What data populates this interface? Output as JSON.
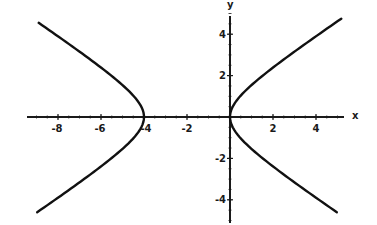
{
  "chart_data": {
    "type": "line",
    "title": "",
    "xlabel": "x",
    "ylabel": "y",
    "xlim": [
      -9.3,
      5.3
    ],
    "ylim": [
      -5.0,
      5.0
    ],
    "grid": false,
    "legend": null,
    "x_ticks": [
      -8,
      -6,
      -4,
      -2,
      2,
      4
    ],
    "x_tick_labels": [
      "-8",
      "-6",
      "-4",
      "-2",
      "2",
      "4"
    ],
    "y_ticks": [
      4,
      2,
      -2,
      -4
    ],
    "y_tick_labels": [
      "4",
      "2",
      "-2",
      "-4"
    ],
    "curve_description": "Hyperbola with vertices at (-4, 0) and (0, 0), centered at (-2, 0), opening left and right",
    "equation_estimate": "(x+2)^2/4 - y^2/2 = 1",
    "series": [
      {
        "name": "left branch",
        "points": [
          [
            -9.1,
            4.5
          ],
          [
            -8,
            3.7
          ],
          [
            -6,
            2.4
          ],
          [
            -5,
            1.6
          ],
          [
            -4.5,
            1.1
          ],
          [
            -4,
            0
          ],
          [
            -4.5,
            -1.1
          ],
          [
            -5,
            -1.6
          ],
          [
            -6,
            -2.4
          ],
          [
            -8,
            -3.7
          ],
          [
            -9.0,
            -4.5
          ]
        ]
      },
      {
        "name": "right branch",
        "points": [
          [
            0,
            0
          ],
          [
            0.5,
            1.1
          ],
          [
            1,
            1.6
          ],
          [
            2,
            2.4
          ],
          [
            4,
            3.7
          ],
          [
            5,
            4.8
          ],
          [
            4,
            -3.7
          ],
          [
            2,
            -2.4
          ],
          [
            1,
            -1.6
          ],
          [
            0.5,
            -1.1
          ],
          [
            5,
            -4.5
          ]
        ]
      }
    ]
  },
  "axes": {
    "x_label": "x",
    "y_label": "y",
    "x_ticks": [
      {
        "value": -8,
        "label": "-8"
      },
      {
        "value": -6,
        "label": "-6"
      },
      {
        "value": -4,
        "label": "-4"
      },
      {
        "value": -2,
        "label": "-2"
      },
      {
        "value": 2,
        "label": "2"
      },
      {
        "value": 4,
        "label": "4"
      }
    ],
    "y_ticks": [
      {
        "value": 4,
        "label": "4"
      },
      {
        "value": 2,
        "label": "2"
      },
      {
        "value": -2,
        "label": "-2"
      },
      {
        "value": -4,
        "label": "-4"
      }
    ]
  }
}
